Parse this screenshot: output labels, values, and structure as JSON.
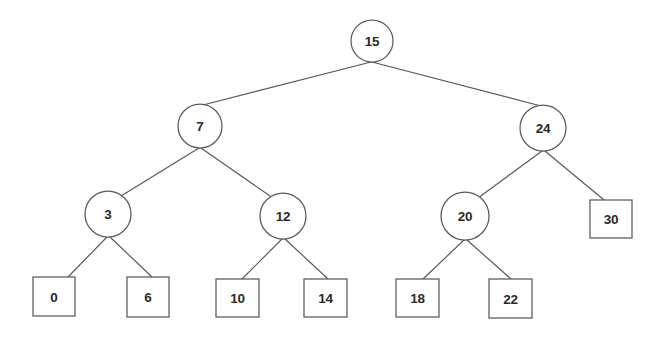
{
  "diagram": {
    "type": "tree-diagram",
    "background_color": "#ffffff",
    "stroke_color": "#5a5a5a",
    "edge_color": "#575757",
    "text_color": "#2a2a2a"
  },
  "nodes": {
    "root": {
      "label": "15",
      "shape": "circle",
      "cx": 372,
      "cy": 41,
      "r": 21
    },
    "n7": {
      "label": "7",
      "shape": "circle",
      "cx": 200,
      "cy": 126,
      "r": 22
    },
    "n24": {
      "label": "24",
      "shape": "circle",
      "cx": 543,
      "cy": 128,
      "r": 23
    },
    "n3": {
      "label": "3",
      "shape": "circle",
      "cx": 108,
      "cy": 214,
      "r": 23
    },
    "n12": {
      "label": "12",
      "shape": "circle",
      "cx": 283,
      "cy": 216,
      "r": 23
    },
    "n20": {
      "label": "20",
      "shape": "circle",
      "cx": 465,
      "cy": 216,
      "r": 24
    },
    "l30": {
      "label": "30",
      "shape": "rect",
      "x": 590,
      "y": 200,
      "w": 42,
      "h": 38
    },
    "l0": {
      "label": "0",
      "shape": "rect",
      "x": 33,
      "y": 277,
      "w": 42,
      "h": 39
    },
    "l6": {
      "label": "6",
      "shape": "rect",
      "x": 127,
      "y": 277,
      "w": 42,
      "h": 40
    },
    "l10": {
      "label": "10",
      "shape": "rect",
      "x": 216,
      "y": 279,
      "w": 43,
      "h": 38
    },
    "l14": {
      "label": "14",
      "shape": "rect",
      "x": 304,
      "y": 279,
      "w": 43,
      "h": 38
    },
    "l18": {
      "label": "18",
      "shape": "rect",
      "x": 396,
      "y": 279,
      "w": 43,
      "h": 38
    },
    "l22": {
      "label": "22",
      "shape": "rect",
      "x": 489,
      "y": 279,
      "w": 43,
      "h": 39
    }
  },
  "edges": [
    {
      "name": "edge-15-7",
      "from": "15",
      "to": "7",
      "x1": 371,
      "y1": 62,
      "x2": 203,
      "y2": 105
    },
    {
      "name": "edge-15-24",
      "from": "15",
      "to": "24",
      "x1": 372,
      "y1": 62,
      "x2": 541,
      "y2": 106
    },
    {
      "name": "edge-7-3",
      "from": "7",
      "to": "3",
      "x1": 199,
      "y1": 148,
      "x2": 121,
      "y2": 196
    },
    {
      "name": "edge-7-12",
      "from": "7",
      "to": "12",
      "x1": 201,
      "y1": 148,
      "x2": 270,
      "y2": 196
    },
    {
      "name": "edge-24-20",
      "from": "24",
      "to": "20",
      "x1": 542,
      "y1": 151,
      "x2": 478,
      "y2": 198
    },
    {
      "name": "edge-24-30",
      "from": "24",
      "to": "30",
      "x1": 545,
      "y1": 151,
      "x2": 604,
      "y2": 200
    },
    {
      "name": "edge-3-0",
      "from": "3",
      "to": "0",
      "x1": 107,
      "y1": 237,
      "x2": 68,
      "y2": 277
    },
    {
      "name": "edge-3-6",
      "from": "3",
      "to": "6",
      "x1": 110,
      "y1": 237,
      "x2": 152,
      "y2": 277
    },
    {
      "name": "edge-12-10",
      "from": "12",
      "to": "10",
      "x1": 282,
      "y1": 239,
      "x2": 242,
      "y2": 279
    },
    {
      "name": "edge-12-14",
      "from": "12",
      "to": "14",
      "x1": 285,
      "y1": 239,
      "x2": 328,
      "y2": 279
    },
    {
      "name": "edge-20-18",
      "from": "20",
      "to": "18",
      "x1": 464,
      "y1": 240,
      "x2": 423,
      "y2": 279
    },
    {
      "name": "edge-20-22",
      "from": "20",
      "to": "22",
      "x1": 467,
      "y1": 240,
      "x2": 511,
      "y2": 279
    }
  ]
}
